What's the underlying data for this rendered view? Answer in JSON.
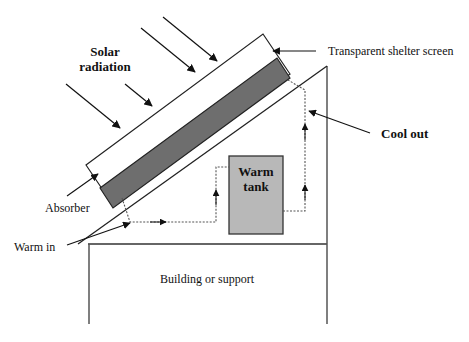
{
  "diagram": {
    "labels": {
      "solar_radiation_line1": "Solar",
      "solar_radiation_line2": "radiation",
      "shelter_screen": "Transparent shelter screen",
      "cool_out": "Cool out",
      "absorber": "Absorber",
      "warm_in": "Warm in",
      "tank_line1": "Warm",
      "tank_line2": "tank",
      "building": "Building or support"
    },
    "colors": {
      "absorber_fill": "#6e6e6e",
      "tank_fill": "#b8b8b8",
      "line": "#222222",
      "pipe": "#555555",
      "background": "#ffffff"
    }
  }
}
